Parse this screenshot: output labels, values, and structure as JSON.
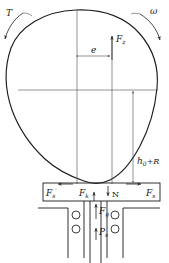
{
  "diagram": {
    "labels": {
      "torque": "T",
      "torque_prime": "′",
      "angular_velocity": "ω",
      "force_z": "F",
      "force_z_sub": "z",
      "eccentricity": "e",
      "height_radius": "h",
      "height_radius_sub": "0",
      "height_radius_tail": "+R",
      "friction_left": "F",
      "friction_left_prime": "′",
      "friction_left_sub": "s",
      "force_k": "F",
      "force_k_sub": "k",
      "normal_force": "N",
      "friction_right": "F",
      "friction_right_sub": "s",
      "gas_force": "F",
      "gas_force_sub": "g",
      "pressure": "P",
      "pressure_sub": "s"
    },
    "colors": {
      "outline": "#1c1c1c",
      "thin_line": "#4a4a4a",
      "background": "#ffffff",
      "text": "#1a1a1a"
    }
  }
}
